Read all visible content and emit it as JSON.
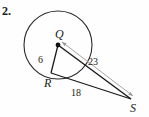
{
  "figure": {
    "problem_number": "2.",
    "background_color": "#fefefe",
    "stroke_color": "#1a1a1a",
    "measure_arrow_color": "#9a9a9a",
    "points": {
      "center": {
        "label": "Q",
        "x": 58,
        "y": 45
      },
      "tangent_point": {
        "label": "R",
        "x": 51,
        "y": 73
      },
      "external_point": {
        "label": "S",
        "x": 131,
        "y": 99
      }
    },
    "circle": {
      "cx": 58,
      "cy": 45,
      "r": 34
    },
    "segments": [
      {
        "name": "radius-QR",
        "from": "Q",
        "to": "R",
        "length_label": "6"
      },
      {
        "name": "tangent-RS",
        "from": "R",
        "to": "S",
        "length_label": "18"
      },
      {
        "name": "hypotenuse-QS",
        "from": "Q",
        "to": "S",
        "length_label": "23"
      }
    ],
    "labels": {
      "radius_length": "6",
      "hypotenuse_length": "23",
      "tangent_length": "18"
    }
  }
}
